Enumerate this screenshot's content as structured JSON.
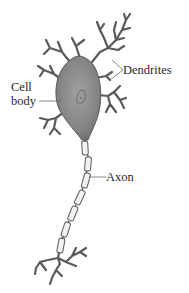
{
  "diagram": {
    "labels": {
      "dendrites": "Dendrites",
      "cell_body_line1": "Cell",
      "cell_body_line2": "body",
      "axon": "Axon"
    },
    "colors": {
      "cell_body_fill": "#8a8a8a",
      "cell_body_highlight": "#a8a8a8",
      "outline": "#555555",
      "dendrite": "#5a5a5a",
      "myelin_fill": "#f2f2f2",
      "leader_line": "#6a6a6a",
      "text": "#2a2a2a",
      "background": "#ffffff"
    }
  }
}
